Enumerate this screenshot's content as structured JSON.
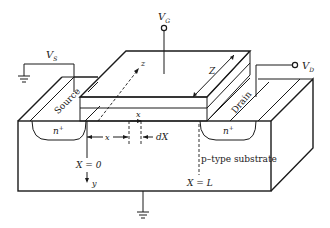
{
  "diagram": {
    "type": "MOSFET cross-section (3D perspective)",
    "terminals": {
      "gate": "V",
      "gate_sub": "G",
      "source": "V",
      "source_sub": "S",
      "drain": "V",
      "drain_sub": "D"
    },
    "regions": {
      "source_label": "Source",
      "drain_label": "Drain",
      "source_doping": "n",
      "drain_doping": "n",
      "doping_sup": "+",
      "substrate_label": "p–type substrate"
    },
    "dimensions": {
      "z_axis": "z",
      "width": "Z",
      "x_arrow": "x",
      "x_distance": "x",
      "dx": "dX",
      "x0": "X = 0",
      "xL": "X = L",
      "y_axis": "y"
    },
    "colors": {
      "ink": "#1a1a1a",
      "background": "#ffffff"
    }
  }
}
